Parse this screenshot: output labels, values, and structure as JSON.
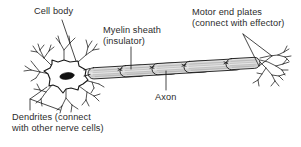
{
  "figure": {
    "background_color": "#ffffff",
    "ink_color": "#1a1a1a",
    "text_color": "#2b2b2b",
    "myelin_fill": "#d9d9d9",
    "nucleus_fill": "#111111",
    "soma_fill": "#ffffff"
  },
  "labels": {
    "cell_body": {
      "line1": "Cell body"
    },
    "myelin_sheath": {
      "line1": "Myelin sheath",
      "line2": "(insulator)"
    },
    "motor_end_plates": {
      "line1": "Motor end plates",
      "line2": "(connect with effector)"
    },
    "axon": {
      "line1": "Axon"
    },
    "dendrites": {
      "line1": "Dendrites (connect",
      "line2": "with other nerve cells)"
    }
  },
  "parts": {
    "soma_name": "cell-body-soma",
    "nucleus_name": "nucleus",
    "dendrites_name": "dendrite-branches",
    "axon_name": "axon",
    "myelin_name": "myelin-sheath-segments",
    "nodes_name": "nodes-of-ranvier",
    "terminals_name": "motor-end-plate-terminals",
    "myelin_segment_count": 5
  }
}
